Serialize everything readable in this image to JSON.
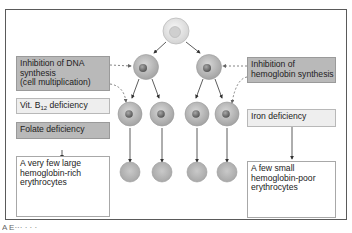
{
  "diagram": {
    "type": "flow",
    "topic": "Erythropoiesis disturbances",
    "labels": {
      "dna_inhibition": [
        "Inhibition of DNA",
        "synthesis",
        "(cell multiplication)"
      ],
      "b12_deficiency_prefix": "Vit. B",
      "b12_deficiency_sub": "12",
      "b12_deficiency_suffix": " deficiency",
      "folate_deficiency": "Folate deficiency",
      "large_cells_result": [
        "A very few large",
        "hemoglobin-rich",
        "erythrocytes"
      ],
      "hb_inhibition": [
        "Inhibition of",
        "hemoglobin synthesis"
      ],
      "iron_deficiency": "Iron deficiency",
      "small_cells_result": [
        "A few small",
        "hemoglobin-poor",
        "erythrocytes"
      ]
    },
    "caption_partial": "A  E···  ·  ·  ·"
  },
  "colors": {
    "frame": "#5a5a5a",
    "cell_outer": "#b8b8b8",
    "cell_nucleus": "#7d7d7d",
    "stem_cell": "#e4e4e4",
    "gray_box": "#b9b9b9",
    "light_box": "#eeeeee",
    "arrow": "#333333",
    "dashed": "#8a8a8a"
  }
}
